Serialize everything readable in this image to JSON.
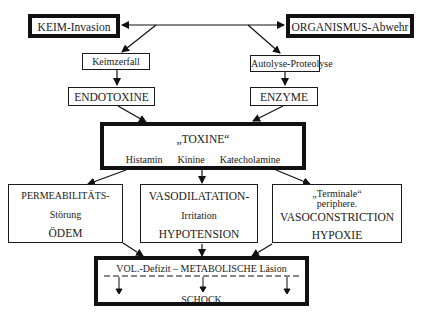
{
  "diagram": {
    "top": {
      "left": "KEIM-Invasion",
      "right": "ORGANISMUS-Abwehr"
    },
    "level2": {
      "left": "Keimzerfall",
      "right": "Autolyse-Proteolyse"
    },
    "level3": {
      "left": "ENDOTOXINE",
      "right": "ENZYME"
    },
    "toxine": {
      "title": "„TOXINE“",
      "items": [
        "Histamin",
        "Kinine",
        "Katecholamine"
      ]
    },
    "effects": [
      {
        "title": "PERMEABILITÄTS-",
        "sub": "Störung",
        "result": "ÖDEM"
      },
      {
        "title": "VASODILATATION-",
        "sub": "Irritation",
        "result": "HYPOTENSION"
      },
      {
        "title": "„Terminale“",
        "sub": "periphere.",
        "mid": "VASOCONSTRICTION",
        "result": "HYPOXIE"
      }
    ],
    "final": {
      "header": "VOL.-Defizit – METABOLISCHE Läsion",
      "result": "SCHOCK"
    }
  }
}
